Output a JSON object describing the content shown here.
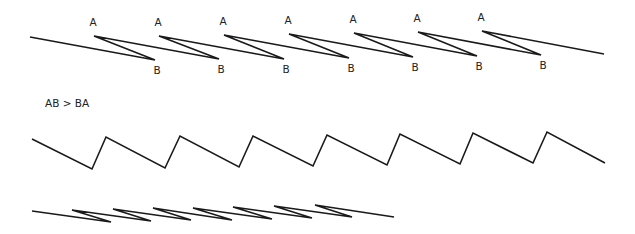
{
  "diagram": {
    "top_row": {
      "start": [
        30,
        37
      ],
      "end": [
        604,
        54
      ],
      "peak_label": "A",
      "trough_label": "B",
      "peaks": [
        [
          94,
          36
        ],
        [
          159,
          36
        ],
        [
          224,
          35
        ],
        [
          289,
          34
        ],
        [
          354,
          33
        ],
        [
          418,
          32
        ],
        [
          482,
          31
        ]
      ],
      "troughs": [
        [
          155,
          60
        ],
        [
          219,
          59
        ],
        [
          284,
          59
        ],
        [
          349,
          58
        ],
        [
          413,
          57
        ],
        [
          477,
          56
        ],
        [
          541,
          55
        ]
      ]
    },
    "caption": "AB > BA",
    "middle_row": {
      "start": [
        32,
        139
      ],
      "end": [
        605,
        163
      ],
      "troughs": [
        [
          92,
          169
        ],
        [
          165,
          168
        ],
        [
          239,
          167
        ],
        [
          313,
          166
        ],
        [
          387,
          165
        ],
        [
          460,
          164
        ],
        [
          533,
          163
        ]
      ],
      "peaks": [
        [
          106,
          137
        ],
        [
          180,
          136
        ],
        [
          253,
          136
        ],
        [
          327,
          135
        ],
        [
          400,
          134
        ],
        [
          473,
          133
        ],
        [
          547,
          132
        ]
      ]
    },
    "bottom_row": {
      "start": [
        32,
        211
      ],
      "end": [
        394,
        217
      ],
      "peaks": [
        [
          72,
          210
        ],
        [
          113,
          209
        ],
        [
          153,
          208
        ],
        [
          193,
          208
        ],
        [
          233,
          207
        ],
        [
          274,
          206
        ],
        [
          315,
          205
        ]
      ],
      "troughs": [
        [
          111,
          222
        ],
        [
          151,
          221
        ],
        [
          191,
          220
        ],
        [
          232,
          220
        ],
        [
          272,
          219
        ],
        [
          312,
          218
        ],
        [
          352,
          217
        ]
      ]
    },
    "stroke_color": "#1a1a1a"
  }
}
